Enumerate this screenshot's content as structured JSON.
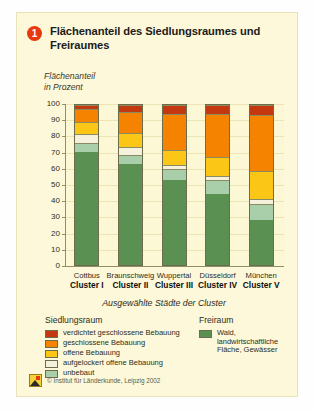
{
  "card": {
    "number_badge": "1",
    "title": "Flächenanteil des Siedlungsraumes und Freiraumes",
    "background_color": "#fdf8d9"
  },
  "chart_data": {
    "type": "bar",
    "subtype": "stacked-percentage",
    "title": "Flächenanteil des Siedlungsraumes und Freiraumes",
    "ylabel": "Flächenanteil in Prozent",
    "ylabel_line1": "Flächenanteil",
    "ylabel_line2": "in Prozent",
    "xlabel": "Ausgewählte Städte der Cluster",
    "ylim": [
      0,
      100
    ],
    "yticks": [
      0,
      10,
      20,
      30,
      40,
      50,
      60,
      70,
      80,
      90,
      100
    ],
    "grid": true,
    "legend_position": "bottom",
    "categories": [
      "Cottbus",
      "Braunschweig",
      "Wuppertal",
      "Düsseldorf",
      "München"
    ],
    "category_sublabels": [
      "Cluster I",
      "Cluster II",
      "Cluster III",
      "Cluster IV",
      "Cluster V"
    ],
    "series": [
      {
        "name": "Wald, landwirtschaftliche Fläche, Gewässer",
        "group": "Freiraum",
        "color": "#5a9152",
        "values": [
          73,
          65,
          55,
          46,
          29
        ]
      },
      {
        "name": "unbebaut",
        "group": "Siedlungsraum",
        "color": "#a8cfaa",
        "values": [
          5,
          5,
          6,
          8,
          10
        ]
      },
      {
        "name": "aufgelockert offene Bebauung",
        "group": "Siedlungsraum",
        "color": "#f6f1dc",
        "values": [
          5,
          5,
          2,
          2,
          2
        ]
      },
      {
        "name": "offene Bebauung",
        "group": "Siedlungsraum",
        "color": "#fcc616",
        "values": [
          7,
          8,
          9,
          12,
          18
        ]
      },
      {
        "name": "geschlossene Bebauung",
        "group": "Siedlungsraum",
        "color": "#f58300",
        "values": [
          8,
          13,
          23,
          27,
          35
        ]
      },
      {
        "name": "verdichtet geschlossene Bebauung",
        "group": "Siedlungsraum",
        "color": "#c4380f",
        "values": [
          2,
          4,
          5,
          5,
          6
        ]
      }
    ]
  },
  "legend": {
    "left_heading": "Siedlungsraum",
    "right_heading": "Freiraum",
    "left_items": [
      {
        "label": "verdichtet geschlossene Bebauung",
        "color": "#c4380f"
      },
      {
        "label": "geschlossene Bebauung",
        "color": "#f58300"
      },
      {
        "label": "offene Bebauung",
        "color": "#fcc616"
      },
      {
        "label": "aufgelockert offene Bebauung",
        "color": "#f6f1dc"
      },
      {
        "label": "unbebaut",
        "color": "#a8cfaa"
      }
    ],
    "right_items": [
      {
        "label": "Wald, landwirtschaftliche Fläche, Gewässer",
        "color": "#5a9152"
      }
    ]
  },
  "footer": {
    "copyright": "© Institut für Länderkunde, Leipzig 2002",
    "logo_name": "institut-logo"
  }
}
